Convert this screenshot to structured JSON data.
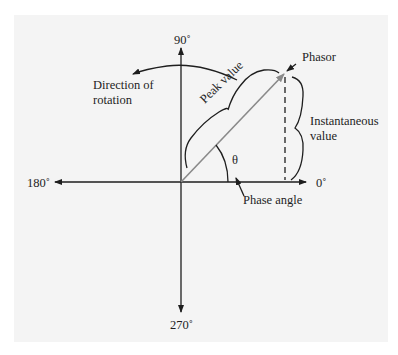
{
  "diagram": {
    "type": "phasor diagram",
    "axes": {
      "top": "90˚",
      "left": "180˚",
      "right": "0˚",
      "bottom": "270˚"
    },
    "labels": {
      "phasor": "Phasor",
      "peak_value": "Peak value",
      "instantaneous_line1": "Instantaneous",
      "instantaneous_line2": "value",
      "direction_line1": "Direction of",
      "direction_line2": "rotation",
      "theta": "θ",
      "phase_angle": "Phase angle"
    },
    "colors": {
      "background": "#f4f4f4",
      "ink": "#1e1e1e",
      "phasor": "#8a8a8a"
    }
  }
}
